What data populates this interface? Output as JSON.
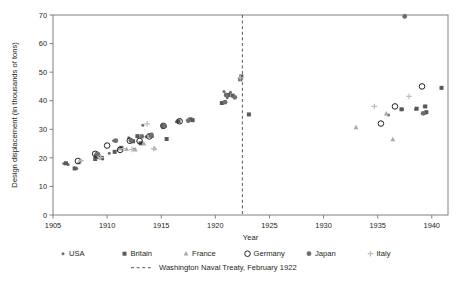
{
  "chart_data": {
    "type": "scatter",
    "title": "",
    "xlabel": "Year",
    "ylabel": "Design displacement (in thousands of tons)",
    "xlim": [
      1905,
      1941.5
    ],
    "ylim": [
      0,
      70
    ],
    "xticks": [
      1905,
      1910,
      1915,
      1920,
      1925,
      1930,
      1935,
      1940
    ],
    "yticks": [
      0,
      10,
      20,
      30,
      40,
      50,
      60,
      70
    ],
    "grid": false,
    "legend_position": "bottom",
    "annotations": [
      {
        "name": "washington-naval-treaty",
        "label": "Washington Naval Treaty, February 1922",
        "type": "vline",
        "x": 1922.5,
        "style": "dashed",
        "color": "#58595b"
      }
    ],
    "series": [
      {
        "name": "USA",
        "marker": "small-dot",
        "color": "#6d6e71",
        "points": [
          [
            1906.0,
            18.0
          ],
          [
            1906.4,
            17.7
          ],
          [
            1907.2,
            16.3
          ],
          [
            1909.0,
            21.0
          ],
          [
            1909.3,
            20.0
          ],
          [
            1909.6,
            19.6
          ],
          [
            1910.2,
            21.6
          ],
          [
            1910.6,
            26.0
          ],
          [
            1911.4,
            23.4
          ],
          [
            1912.0,
            27.0
          ],
          [
            1912.2,
            26.0
          ],
          [
            1912.5,
            23.0
          ],
          [
            1913.3,
            31.4
          ],
          [
            1913.6,
            27.4
          ],
          [
            1914.2,
            27.5
          ],
          [
            1915.1,
            31.5
          ],
          [
            1915.4,
            31.0
          ],
          [
            1916.4,
            32.6
          ],
          [
            1920.8,
            43.2
          ],
          [
            1921.1,
            41.0
          ],
          [
            1921.4,
            43.0
          ],
          [
            1936.0,
            35.0
          ],
          [
            1937.3,
            37.0
          ],
          [
            1938.5,
            37.0
          ],
          [
            1939.3,
            38.0
          ],
          [
            1939.4,
            35.5
          ]
        ]
      },
      {
        "name": "Britain",
        "marker": "square",
        "color": "#58595b",
        "points": [
          [
            1906.2,
            18.1
          ],
          [
            1907.0,
            16.3
          ],
          [
            1908.9,
            19.6
          ],
          [
            1909.5,
            20.0
          ],
          [
            1910.7,
            22.1
          ],
          [
            1911.3,
            23.5
          ],
          [
            1912.4,
            25.8
          ],
          [
            1912.8,
            27.6
          ],
          [
            1913.1,
            25.1
          ],
          [
            1914.0,
            27.8
          ],
          [
            1915.2,
            31.0
          ],
          [
            1915.5,
            26.6
          ],
          [
            1916.6,
            32.8
          ],
          [
            1917.7,
            33.5
          ],
          [
            1917.9,
            33.2
          ],
          [
            1920.6,
            39.2
          ],
          [
            1921.2,
            42.0
          ],
          [
            1921.6,
            41.8
          ],
          [
            1922.3,
            47.5
          ],
          [
            1922.4,
            48.5
          ],
          [
            1923.1,
            35.2
          ],
          [
            1937.2,
            37.0
          ],
          [
            1938.6,
            37.2
          ],
          [
            1939.4,
            38.0
          ],
          [
            1939.5,
            36.0
          ],
          [
            1940.9,
            44.5
          ]
        ]
      },
      {
        "name": "France",
        "marker": "triangle",
        "color": "#a7a9ac",
        "points": [
          [
            1907.4,
            18.4
          ],
          [
            1909.2,
            20.2
          ],
          [
            1911.1,
            23.2
          ],
          [
            1911.8,
            23.1
          ],
          [
            1912.6,
            22.9
          ],
          [
            1913.4,
            25.0
          ],
          [
            1914.4,
            23.3
          ],
          [
            1933.0,
            30.7
          ],
          [
            1935.8,
            35.5
          ],
          [
            1936.4,
            26.5
          ]
        ]
      },
      {
        "name": "Germany",
        "marker": "open-circle",
        "color": "#231f20",
        "points": [
          [
            1907.3,
            18.9
          ],
          [
            1908.9,
            21.4
          ],
          [
            1909.1,
            20.9
          ],
          [
            1910.0,
            24.3
          ],
          [
            1911.2,
            22.8
          ],
          [
            1912.1,
            26.0
          ],
          [
            1913.0,
            25.9
          ],
          [
            1913.9,
            27.5
          ],
          [
            1915.2,
            31.2
          ],
          [
            1916.7,
            32.8
          ],
          [
            1935.3,
            32.0
          ],
          [
            1936.6,
            38.0
          ],
          [
            1939.1,
            45.0
          ]
        ]
      },
      {
        "name": "Japan",
        "marker": "filled-circle",
        "color": "#6d6e71",
        "points": [
          [
            1909.1,
            21.4
          ],
          [
            1910.8,
            26.0
          ],
          [
            1912.2,
            26.1
          ],
          [
            1913.2,
            27.5
          ],
          [
            1914.1,
            28.0
          ],
          [
            1915.3,
            31.2
          ],
          [
            1917.5,
            33.0
          ],
          [
            1920.9,
            39.5
          ],
          [
            1921.0,
            42.0
          ],
          [
            1921.8,
            41.2
          ],
          [
            1937.5,
            69.5
          ],
          [
            1939.2,
            35.6
          ]
        ]
      },
      {
        "name": "Italy",
        "marker": "plus",
        "color": "#bcbec0",
        "points": [
          [
            1907.6,
            19.0
          ],
          [
            1909.4,
            20.1
          ],
          [
            1911.5,
            23.2
          ],
          [
            1912.3,
            22.9
          ],
          [
            1913.7,
            31.9
          ],
          [
            1914.3,
            23.2
          ],
          [
            1922.3,
            48.0
          ],
          [
            1934.7,
            38.0
          ],
          [
            1937.9,
            41.5
          ]
        ]
      }
    ]
  },
  "legend": {
    "entries": [
      {
        "label": "USA",
        "marker": "small-dot",
        "color": "#6d6e71"
      },
      {
        "label": "Britain",
        "marker": "square",
        "color": "#58595b"
      },
      {
        "label": "France",
        "marker": "triangle",
        "color": "#a7a9ac"
      },
      {
        "label": "Germany",
        "marker": "open-circle",
        "color": "#231f20"
      },
      {
        "label": "Japan",
        "marker": "filled-circle",
        "color": "#6d6e71"
      },
      {
        "label": "Italy",
        "marker": "plus",
        "color": "#bcbec0"
      }
    ],
    "treaty_label": "Washington Naval Treaty, February 1922"
  }
}
